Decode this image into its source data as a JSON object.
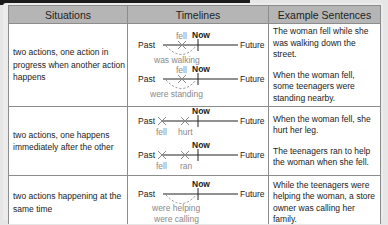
{
  "table": {
    "headers": [
      "Situations",
      "Timelines",
      "Example Sentences"
    ],
    "rows": [
      {
        "situation": "two actions, one action in progress when another action happens",
        "timelines": [
          {
            "past": "Past",
            "now": "Now",
            "future": "Future",
            "above": "fell",
            "below": "was walking"
          },
          {
            "past": "Past",
            "now": "Now",
            "future": "Future",
            "above": "fell",
            "below": "were standing"
          }
        ],
        "examples": [
          "The woman fell while she was walking down the street.",
          "When the woman fell, some teenagers were standing nearby."
        ]
      },
      {
        "situation": "two actions, one happens immediately after the other",
        "timelines": [
          {
            "past": "Past",
            "now": "Now",
            "future": "Future",
            "mark1": "fell",
            "mark2": "hurt"
          },
          {
            "past": "Past",
            "now": "Now",
            "future": "Future",
            "mark1": "fell",
            "mark2": "ran"
          }
        ],
        "examples": [
          "When the woman fell, she hurt her leg.",
          "The teenagers ran to help the woman when she fell."
        ]
      },
      {
        "situation": "two actions happening at the same time",
        "timelines": [
          {
            "past": "Past",
            "now": "Now",
            "future": "Future",
            "below1": "were helping",
            "below2": "were calling"
          }
        ],
        "examples": [
          "While the teenagers were helping the woman, a store owner was calling her family."
        ]
      }
    ]
  }
}
